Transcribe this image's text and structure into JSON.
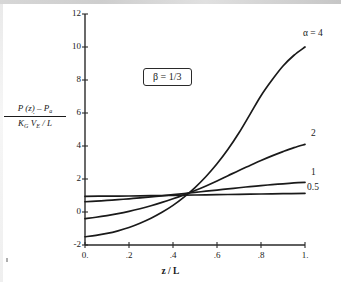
{
  "chart_data": {
    "type": "line",
    "title": "",
    "xlabel": "z / L",
    "ylabel_numerator": "P (z) – P",
    "ylabel_numerator_sub": "a",
    "ylabel_denominator_k": "K",
    "ylabel_denominator_k_sub": "G",
    "ylabel_denominator_v": "V",
    "ylabel_denominator_v_sub": "E",
    "ylabel_denominator_tail": "/  L",
    "annotation": "β  =  1/3",
    "xlim": [
      0,
      1
    ],
    "ylim": [
      -2,
      12
    ],
    "xticks": [
      0,
      0.2,
      0.4,
      0.6,
      0.8,
      1
    ],
    "xticklabels": [
      "0.",
      ".2",
      ".4",
      ".6",
      ".8",
      "1."
    ],
    "yticks": [
      -2,
      0,
      2,
      4,
      6,
      8,
      10,
      12
    ],
    "yticklabels": [
      "-2",
      "0",
      "2",
      "4",
      "6",
      "8",
      "10",
      "12"
    ],
    "grid": false,
    "legend_position": "right-of-curve-ends",
    "series": [
      {
        "name": "α = 4",
        "label": "α  =  4",
        "color": "#1a1a1a",
        "x": [
          0.0,
          0.05,
          0.1,
          0.15,
          0.2,
          0.25,
          0.3,
          0.35,
          0.4,
          0.45,
          0.5,
          0.55,
          0.6,
          0.65,
          0.7,
          0.75,
          0.8,
          0.85,
          0.9,
          0.95,
          1.0
        ],
        "y": [
          -1.5,
          -1.42,
          -1.3,
          -1.14,
          -0.94,
          -0.68,
          -0.38,
          -0.02,
          0.4,
          0.9,
          1.48,
          2.15,
          2.92,
          3.8,
          4.8,
          5.92,
          7.05,
          8.0,
          8.85,
          9.5,
          10.0
        ]
      },
      {
        "name": "2",
        "label": "2",
        "color": "#1a1a1a",
        "x": [
          0.0,
          0.05,
          0.1,
          0.15,
          0.2,
          0.25,
          0.3,
          0.35,
          0.4,
          0.45,
          0.5,
          0.55,
          0.6,
          0.65,
          0.7,
          0.75,
          0.8,
          0.85,
          0.9,
          0.95,
          1.0
        ],
        "y": [
          -0.4,
          -0.32,
          -0.22,
          -0.1,
          0.04,
          0.2,
          0.38,
          0.58,
          0.8,
          1.04,
          1.3,
          1.58,
          1.88,
          2.2,
          2.52,
          2.82,
          3.12,
          3.4,
          3.66,
          3.9,
          4.1
        ]
      },
      {
        "name": "1",
        "label": "1",
        "color": "#1a1a1a",
        "x": [
          0.0,
          0.05,
          0.1,
          0.15,
          0.2,
          0.25,
          0.3,
          0.35,
          0.4,
          0.45,
          0.5,
          0.55,
          0.6,
          0.65,
          0.7,
          0.75,
          0.8,
          0.85,
          0.9,
          0.95,
          1.0
        ],
        "y": [
          0.62,
          0.66,
          0.7,
          0.75,
          0.8,
          0.86,
          0.92,
          0.98,
          1.05,
          1.12,
          1.19,
          1.26,
          1.33,
          1.4,
          1.47,
          1.54,
          1.6,
          1.66,
          1.71,
          1.76,
          1.8
        ]
      },
      {
        "name": "0.5",
        "label": "0.5",
        "color": "#1a1a1a",
        "x": [
          0.0,
          0.1,
          0.2,
          0.3,
          0.4,
          0.5,
          0.6,
          0.7,
          0.8,
          0.9,
          1.0
        ],
        "y": [
          0.95,
          0.96,
          0.97,
          0.99,
          1.01,
          1.03,
          1.05,
          1.07,
          1.09,
          1.11,
          1.13
        ]
      }
    ]
  },
  "labels": {
    "alpha_label": "α  =  4",
    "series2": "2",
    "series1": "1",
    "series05": "0.5",
    "beta": "β  =  1/3",
    "xaxis": "z / L"
  }
}
